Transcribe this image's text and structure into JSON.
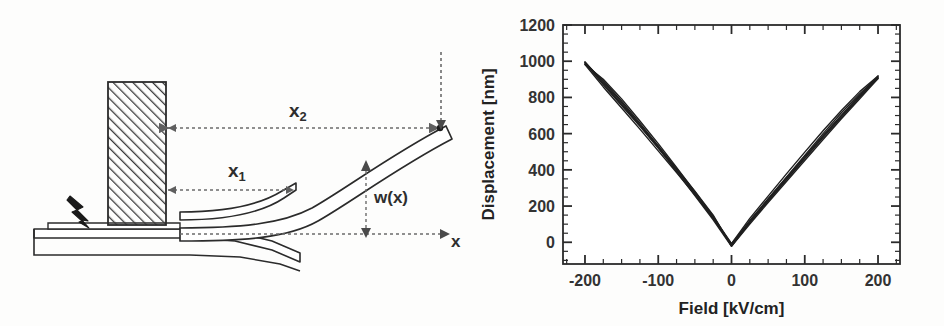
{
  "figure": {
    "panels": [
      {
        "id": "cantilever-diagram",
        "kind": "schematic"
      },
      {
        "id": "displacement-field-plot",
        "kind": "chart"
      }
    ]
  },
  "diagram": {
    "labels": {
      "x2_base": "x",
      "x2_sub": "2",
      "x1_base": "x",
      "x1_sub": "1",
      "deflection": "w(x)",
      "axis": "x"
    },
    "parts": [
      {
        "name": "substrate-base",
        "label": "substrate"
      },
      {
        "name": "hatched-block",
        "label": "proof mass"
      },
      {
        "name": "piezo-layer",
        "label": "piezoelectric layer"
      },
      {
        "name": "cantilever-beam",
        "label": "cantilever beam"
      },
      {
        "name": "lightning-bolt-icon",
        "label": "electrical excitation"
      }
    ],
    "colors": {
      "line": "#2b2b2b",
      "hatch": "#3a3a3a",
      "dashed": "#6b6b6b",
      "fill": "#ffffff"
    }
  },
  "chart_data": {
    "type": "line",
    "title": "",
    "xlabel": "Field [kV/cm]",
    "ylabel": "Displacement [nm]",
    "xlim": [
      -230,
      230
    ],
    "ylim": [
      -120,
      1200
    ],
    "xticks": [
      -200,
      -100,
      0,
      100,
      200
    ],
    "xtick_labels": [
      "-200",
      "-100",
      "0",
      "100",
      "200"
    ],
    "yticks": [
      0,
      200,
      400,
      600,
      800,
      1000,
      1200
    ],
    "ytick_labels": [
      "0",
      "200",
      "400",
      "600",
      "800",
      "1000",
      "1200"
    ],
    "x_minor_tick_step": 25,
    "y_minor_tick_step": 50,
    "grid": false,
    "legend": null,
    "line_color": "#1f1f1f",
    "line_width": 1.4,
    "series": [
      {
        "name": "loop-1",
        "x": [
          -200,
          -175,
          -150,
          -125,
          -100,
          -75,
          -50,
          -25,
          0,
          25,
          50,
          75,
          100,
          125,
          150,
          175,
          200
        ],
        "y": [
          990,
          870,
          755,
          640,
          520,
          400,
          275,
          145,
          -18,
          120,
          240,
          360,
          480,
          600,
          715,
          820,
          912
        ]
      },
      {
        "name": "loop-1-return",
        "x": [
          200,
          175,
          150,
          125,
          100,
          75,
          50,
          25,
          0,
          -25,
          -50,
          -75,
          -100,
          -125,
          -150,
          -175,
          -200
        ],
        "y": [
          912,
          800,
          690,
          578,
          462,
          345,
          228,
          108,
          -18,
          132,
          268,
          400,
          532,
          658,
          780,
          892,
          990
        ]
      },
      {
        "name": "loop-2",
        "x": [
          -200,
          -175,
          -150,
          -125,
          -100,
          -75,
          -50,
          -25,
          0,
          25,
          50,
          75,
          100,
          125,
          150,
          175,
          200
        ],
        "y": [
          982,
          858,
          742,
          625,
          505,
          385,
          262,
          132,
          -8,
          132,
          255,
          378,
          498,
          616,
          728,
          832,
          918
        ]
      },
      {
        "name": "loop-2-return",
        "x": [
          200,
          175,
          150,
          125,
          100,
          75,
          50,
          25,
          0,
          -25,
          -50,
          -75,
          -100,
          -125,
          -150,
          -175,
          -200
        ],
        "y": [
          918,
          812,
          702,
          590,
          474,
          356,
          238,
          116,
          -8,
          142,
          280,
          414,
          545,
          670,
          792,
          900,
          982
        ]
      },
      {
        "name": "loop-3",
        "x": [
          -200,
          -175,
          -150,
          -125,
          -100,
          -75,
          -50,
          -25,
          0,
          25,
          50,
          75,
          100,
          125,
          150,
          175,
          200
        ],
        "y": [
          996,
          878,
          762,
          648,
          530,
          408,
          282,
          150,
          -22,
          112,
          230,
          348,
          466,
          584,
          698,
          806,
          905
        ]
      },
      {
        "name": "loop-3-return",
        "x": [
          200,
          175,
          150,
          125,
          100,
          75,
          50,
          25,
          0,
          -25,
          -50,
          -75,
          -100,
          -125,
          -150,
          -175,
          -200
        ],
        "y": [
          905,
          792,
          682,
          568,
          452,
          336,
          220,
          100,
          -22,
          124,
          258,
          390,
          522,
          648,
          772,
          886,
          996
        ]
      }
    ]
  }
}
